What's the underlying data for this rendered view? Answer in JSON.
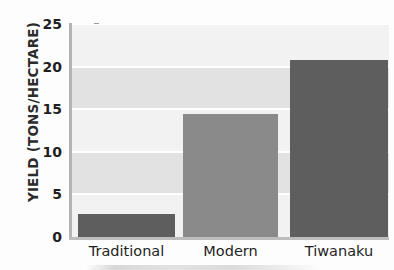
{
  "chart_data": {
    "type": "bar",
    "title": "",
    "xlabel": "",
    "ylabel": "YIELD (TONS/HECTARE)",
    "categories": [
      "Traditional",
      "Modern",
      "Tiwanaku"
    ],
    "values": [
      2.7,
      14.4,
      20.8
    ],
    "ylim": [
      0,
      25
    ],
    "yticks": [
      0,
      5,
      10,
      15,
      20,
      25
    ],
    "ytick_labels": [
      "0",
      "5",
      "10",
      "15",
      "20",
      "25"
    ],
    "grid": "horizontal-white-gridlines-with-alternating-gray-bands",
    "legend": "none",
    "bar_colors": [
      "#5e5e5e",
      "#8a8a8a",
      "#5e5e5e"
    ],
    "colors": {
      "bar_dark": "#5e5e5e",
      "bar_medium": "#8a8a8a",
      "plot_band_light": "#f2f2f2",
      "plot_band_dark": "#e2e2e2",
      "gridline": "#ffffff",
      "axis": "#b3b3b3",
      "text": "#1f1f1f",
      "page": "#fdfdfd"
    }
  }
}
